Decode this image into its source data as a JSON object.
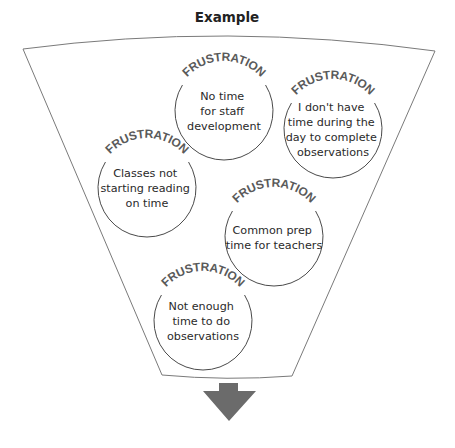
{
  "title": "Example",
  "colors": {
    "funnel_stroke": "#7a7a7a",
    "bubble_stroke": "#4a4a4a",
    "label_color": "#5a5a5a",
    "text_color": "#2a2a2a",
    "arrow_fill": "#6b6b6b"
  },
  "funnel": {
    "shape": "funnel-icon",
    "top_left": [
      23,
      49
    ],
    "top_right": [
      435,
      51
    ],
    "bottom_left": [
      162,
      375
    ],
    "bottom_right": [
      292,
      376
    ]
  },
  "bubbles": [
    {
      "label": "FRUSTRATION",
      "lines": [
        "No time",
        "for staff",
        "development"
      ],
      "cx": 224,
      "cy": 111,
      "r": 49
    },
    {
      "label": "FRUSTRATION",
      "lines": [
        "I don't have",
        "time during the",
        "day to complete",
        "observations"
      ],
      "cx": 333,
      "cy": 129,
      "r": 49
    },
    {
      "label": "FRUSTRATION",
      "lines": [
        "Classes not",
        "starting reading",
        "on time"
      ],
      "cx": 147,
      "cy": 188,
      "r": 49
    },
    {
      "label": "FRUSTRATION",
      "lines": [
        "Common prep",
        "time for teachers"
      ],
      "cx": 274,
      "cy": 237,
      "r": 49
    },
    {
      "label": "FRUSTRATION",
      "lines": [
        "Not enough",
        "time to do",
        "observations"
      ],
      "cx": 203,
      "cy": 321,
      "r": 49
    }
  ],
  "arrow": {
    "icon": "down-arrow-icon",
    "direction": "down"
  }
}
